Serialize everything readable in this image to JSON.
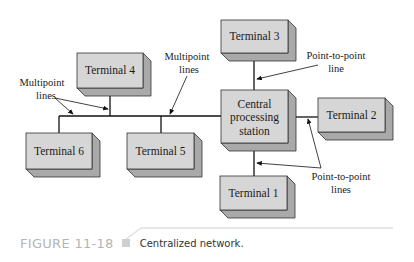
{
  "diagram": {
    "title": "Centralized network",
    "nodes": [
      {
        "id": "terminal3",
        "label": "Terminal 3"
      },
      {
        "id": "terminal4",
        "label": "Terminal 4"
      },
      {
        "id": "central",
        "label_lines": [
          "Central",
          "processing",
          "station"
        ]
      },
      {
        "id": "terminal2",
        "label": "Terminal 2"
      },
      {
        "id": "terminal6",
        "label": "Terminal 6"
      },
      {
        "id": "terminal5",
        "label": "Terminal 5"
      },
      {
        "id": "terminal1",
        "label": "Terminal 1"
      }
    ],
    "callouts": {
      "multipoint_left": [
        "Multipoint",
        "lines"
      ],
      "multipoint_top": [
        "Multipoint",
        "lines"
      ],
      "p2p_line": [
        "Point-to-point",
        "line"
      ],
      "p2p_lines": [
        "Point-to-point",
        "lines"
      ]
    },
    "colors": {
      "box_front": "#d6d6d6",
      "box_side": "#a9a9a9",
      "box_bottom": "#bdbdbd",
      "line": "#111111"
    }
  },
  "caption": {
    "figure_number": "FIGURE 11-18",
    "text": "Centralized network."
  }
}
